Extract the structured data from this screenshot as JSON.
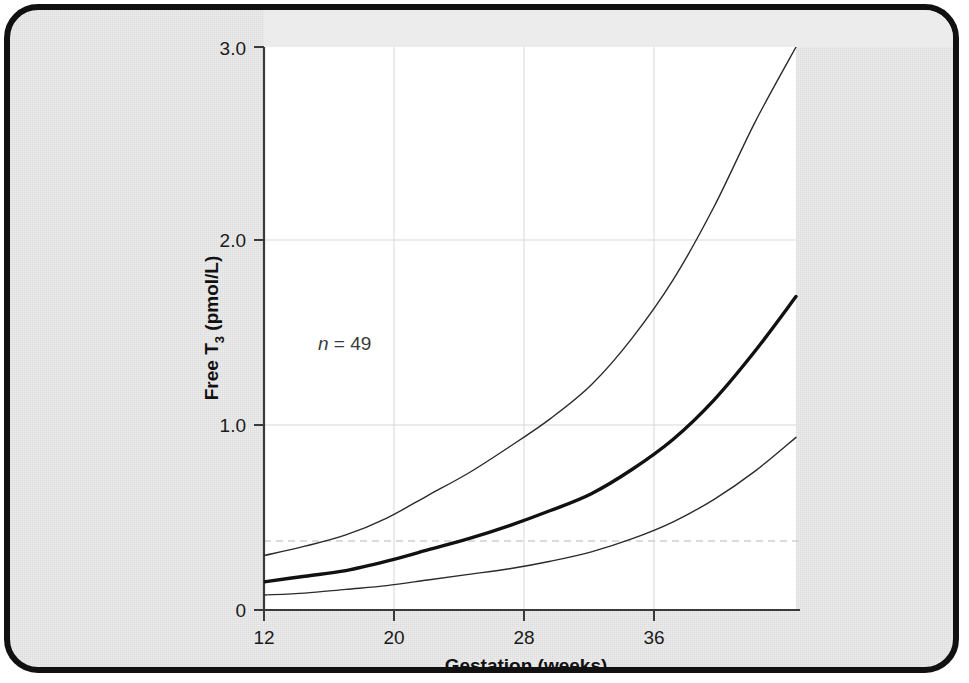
{
  "figure": {
    "background_color": "#ececec",
    "panel_color": "#ffffff",
    "border_color": "#111111"
  },
  "axes": {
    "y_title_main": "Free T",
    "y_title_sub": "3",
    "y_title_units": " (pmol/L)",
    "x_title": "Gestation (weeks)",
    "y_ticks": [
      "0",
      "1.0",
      "2.0",
      "3.0"
    ],
    "x_ticks": [
      "12",
      "20",
      "28",
      "36"
    ]
  },
  "annotation": {
    "n_symbol": "n",
    "n_text": " = 49"
  },
  "chart_data": {
    "type": "line",
    "title": "",
    "subtitle": "",
    "xlabel": "Gestation (weeks)",
    "ylabel": "Free T3 (pmol/L)",
    "xlim": [
      12,
      38
    ],
    "ylim": [
      0,
      3.0
    ],
    "xticks": [
      12,
      20,
      28,
      36
    ],
    "yticks": [
      0,
      1.0,
      2.0,
      3.0
    ],
    "grid": "horizontal-and-vertical-light",
    "legend": "none",
    "sample_size": 49,
    "reference_line": {
      "name": "lower-limit-dashed",
      "orientation": "horizontal",
      "y": 0.37,
      "style": "dashed",
      "color": "#c9c9c9"
    },
    "x": [
      12,
      14,
      16,
      18,
      20,
      22,
      24,
      26,
      28,
      30,
      32,
      34,
      36,
      38
    ],
    "series": [
      {
        "name": "upper-centile",
        "style": "thin",
        "color": "#2b2b2b",
        "width": 1.4,
        "x_end": 38.0,
        "values": [
          0.29,
          0.34,
          0.4,
          0.49,
          0.61,
          0.73,
          0.87,
          1.02,
          1.2,
          1.45,
          1.76,
          2.15,
          2.6,
          3.0
        ]
      },
      {
        "name": "median",
        "style": "bold",
        "color": "#111111",
        "width": 3.4,
        "x_end": 38.6,
        "values": [
          0.15,
          0.18,
          0.21,
          0.26,
          0.32,
          0.38,
          0.45,
          0.53,
          0.62,
          0.75,
          0.91,
          1.12,
          1.38,
          1.67
        ]
      },
      {
        "name": "lower-centile",
        "style": "thin",
        "color": "#2b2b2b",
        "width": 1.4,
        "x_end": 38.4,
        "values": [
          0.08,
          0.09,
          0.11,
          0.13,
          0.16,
          0.19,
          0.22,
          0.26,
          0.31,
          0.38,
          0.47,
          0.59,
          0.74,
          0.92
        ]
      }
    ]
  }
}
